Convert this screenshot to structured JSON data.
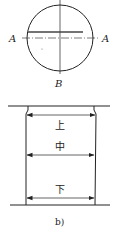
{
  "figure_a": {
    "label_left": "A",
    "label_right": "A",
    "label_bottom": "B",
    "circle": {
      "cx": 60,
      "cy": 38,
      "r": 33
    },
    "section_line": "A-A",
    "center_axis": "B"
  },
  "figure_b": {
    "caption": "b)",
    "measurements": [
      {
        "position": "top",
        "label": "上"
      },
      {
        "position": "middle",
        "label": "中"
      },
      {
        "position": "bottom",
        "label": "下"
      }
    ]
  },
  "colors": {
    "line": "#222222",
    "background": "#ffffff"
  }
}
